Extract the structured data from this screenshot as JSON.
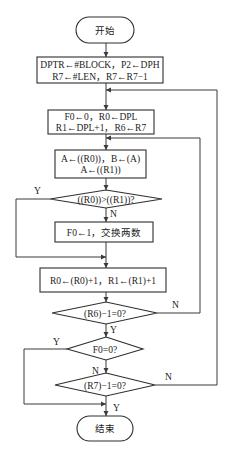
{
  "flowchart": {
    "start": "开始",
    "end": "结束",
    "box1": {
      "line1": "DPTR←#BLOCK，P2←DPH",
      "line2": "R7←#LEN，R7←R7−1"
    },
    "box2": {
      "line1": "F0←0，R0←DPL",
      "line2": "R1←DPL+1，R6←R7"
    },
    "box3": {
      "line1": "A←((R0))，B←(A)",
      "line2": "A←((R1))"
    },
    "decision1": "((R0))>((R1))?",
    "box4": "F0←1，交换两数",
    "box5": "R0←(R0)+1，R1←(R1)+1",
    "decision2": "(R6)−1=0?",
    "decision3": "F0=0?",
    "decision4": "(R7)−1=0?",
    "labels": {
      "d1_yes": "Y",
      "d1_no": "N",
      "d2_yes": "Y",
      "d2_no": "N",
      "d3_yes": "Y",
      "d3_no": "N",
      "d4_yes": "Y",
      "d4_no": "N"
    }
  }
}
